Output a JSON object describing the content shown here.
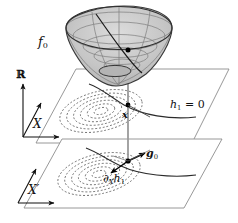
{
  "figure": {
    "type": "math-diagram",
    "width": 238,
    "height": 223,
    "background": "#ffffff"
  },
  "labels": {
    "objective": "f",
    "objective_sub": "0",
    "range_axis": "ℝ",
    "domain_axis": "X",
    "domain_axis_prime": "X′",
    "constraint": "h",
    "constraint_sub": "1",
    "constraint_eq": "= 0",
    "point": "x",
    "gradient": "g",
    "gradient_sub": "0",
    "partial": "∂",
    "partial_sub": "X",
    "partial_h": "h",
    "partial_h_sub": "1"
  },
  "colors": {
    "ink": "#111111",
    "surface_fill": "#c9c9c9",
    "surface_edge": "#3a3a3a",
    "mesh": "#7d7d7d",
    "plane_edge": "#8c8c8c",
    "contour": "#5a5a5a",
    "drop_line": "#9a9a9a",
    "point": "#000000"
  },
  "elements": {
    "surface_name": "paraboloid-bowl",
    "upper_plane_name": "domain-plane-X",
    "lower_plane_name": "domain-plane-X-prime",
    "contour_count_upper": 6,
    "contour_count_lower": 6,
    "constraint_curve_upper": "h1=0 level curve on X",
    "constraint_curve_lower": "h1=0 level curve on X-prime",
    "drop_line": "vertical projection from surface point to planes",
    "vectors": [
      "g0",
      "dX h1"
    ]
  }
}
